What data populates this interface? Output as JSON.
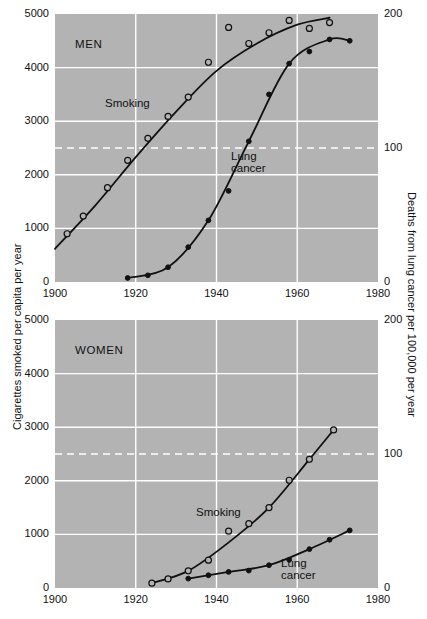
{
  "figure": {
    "background": "#ffffff",
    "plot_background": "#b3b3b3",
    "gridline_color": "#ffffff",
    "curve_color": "#111111"
  },
  "axes": {
    "left_title": "Cigarettes smoked per capita per year",
    "right_title": "Deaths from lung cancer per 100,000 per year",
    "x_ticks": [
      "1900",
      "1920",
      "1940",
      "1960",
      "1980"
    ],
    "y_left_ticks": [
      "0",
      "1000",
      "2000",
      "3000",
      "4000",
      "5000"
    ],
    "y_right_ticks": [
      "0",
      "100",
      "200"
    ]
  },
  "panels": [
    {
      "id": "men",
      "label": "MEN",
      "smoking_label": "Smoking",
      "cancer_label": "Lung cancer"
    },
    {
      "id": "women",
      "label": "WOMEN",
      "smoking_label": "Smoking",
      "cancer_label": "Lung cancer"
    }
  ],
  "chart_data": {
    "type": "line",
    "title": "",
    "xlabel": "",
    "ylabel": "Cigarettes smoked per capita per year",
    "y2label": "Deaths from lung cancer per 100,000 per year",
    "xlim": [
      1900,
      1980
    ],
    "ylim": [
      0,
      5000
    ],
    "y2lim": [
      0,
      200
    ],
    "xticks": [
      1900,
      1920,
      1940,
      1960,
      1980
    ],
    "yticks": [
      0,
      1000,
      2000,
      3000,
      4000,
      5000
    ],
    "y2ticks": [
      0,
      100,
      200
    ],
    "grid": true,
    "dashed_gridline_y": 2500,
    "legend": "inline annotations",
    "panels": [
      {
        "name": "MEN",
        "series": [
          {
            "name": "Smoking",
            "axis": "left",
            "marker": "open-circle",
            "x": [
              1903,
              1907,
              1913,
              1918,
              1923,
              1928,
              1933,
              1938,
              1943,
              1948,
              1953,
              1958,
              1963,
              1968
            ],
            "y": [
              900,
              1230,
              1760,
              2270,
              2680,
              3090,
              3450,
              4100,
              4750,
              4450,
              4650,
              4880,
              4730,
              4840
            ],
            "curve_x": [
              1900,
              1910,
              1920,
              1930,
              1940,
              1950,
              1960,
              1968
            ],
            "curve_y": [
              620,
              1430,
              2330,
              3180,
              3940,
              4450,
              4800,
              4930
            ]
          },
          {
            "name": "Lung cancer",
            "axis": "right",
            "marker": "filled-circle",
            "x": [
              1918,
              1923,
              1928,
              1933,
              1938,
              1943,
              1948,
              1953,
              1958,
              1963,
              1968,
              1973
            ],
            "y": [
              3,
              5,
              11,
              26,
              46,
              68,
              105,
              140,
              163,
              172,
              181,
              180
            ],
            "curve_x": [
              1918,
              1928,
              1938,
              1948,
              1958,
              1968,
              1973
            ],
            "curve_y": [
              3,
              11,
              46,
              105,
              163,
              181,
              180
            ]
          }
        ]
      },
      {
        "name": "WOMEN",
        "series": [
          {
            "name": "Smoking",
            "axis": "left",
            "marker": "open-circle",
            "x": [
              1924,
              1928,
              1933,
              1938,
              1943,
              1948,
              1953,
              1958,
              1963,
              1969
            ],
            "y": [
              90,
              170,
              320,
              520,
              1060,
              1200,
              1500,
              2010,
              2400,
              2950
            ],
            "curve_x": [
              1924,
              1933,
              1943,
              1953,
              1963,
              1969
            ],
            "curve_y": [
              90,
              320,
              850,
              1500,
              2400,
              2950
            ]
          },
          {
            "name": "Lung cancer",
            "axis": "right",
            "marker": "filled-circle",
            "x": [
              1933,
              1938,
              1943,
              1948,
              1953,
              1958,
              1963,
              1968,
              1973
            ],
            "y": [
              7,
              9.5,
              12,
              13,
              17,
              21,
              29,
              36,
              43
            ],
            "curve_x": [
              1933,
              1943,
              1953,
              1963,
              1973
            ],
            "curve_y": [
              7,
              12,
              17,
              29,
              43
            ]
          }
        ]
      }
    ]
  }
}
